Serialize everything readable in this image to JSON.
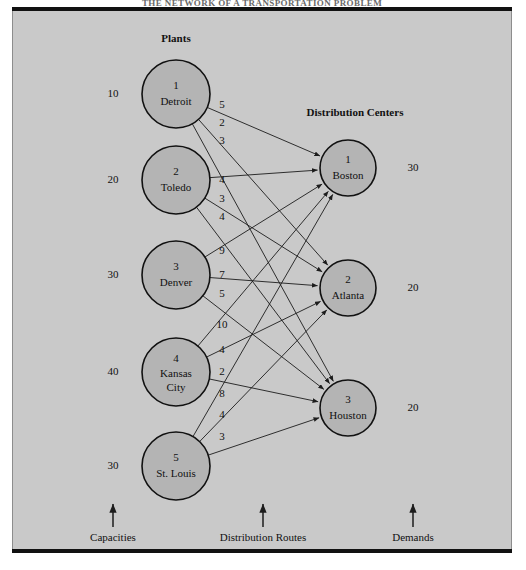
{
  "figure": {
    "top_caption": "THE NETWORK OF A TRANSPORTATION PROBLEM",
    "plants_heading": "Plants",
    "centers_heading": "Distribution Centers"
  },
  "footer": {
    "capacities_label": "Capacities",
    "routes_label": "Distribution Routes",
    "demands_label": "Demands"
  },
  "chart_data": {
    "type": "diagram",
    "title": "THE NETWORK OF A TRANSPORTATION PROBLEM",
    "subtype": "bipartite-transportation-network",
    "sources_group": "Plants",
    "sinks_group": "Distribution Centers",
    "source_value_label": "Capacities",
    "sink_value_label": "Demands",
    "edge_value_label": "Distribution Routes",
    "sources": [
      {
        "index": "1",
        "name": "Detroit",
        "capacity": "10",
        "cx": 176,
        "cy": 94,
        "r": 34
      },
      {
        "index": "2",
        "name": "Toledo",
        "capacity": "20",
        "cx": 176,
        "cy": 180,
        "r": 34
      },
      {
        "index": "3",
        "name": "Denver",
        "capacity": "30",
        "cx": 176,
        "cy": 275,
        "r": 34
      },
      {
        "index": "4",
        "name": "Kansas City",
        "capacity": "40",
        "cx": 176,
        "cy": 372,
        "r": 34
      },
      {
        "index": "5",
        "name": "St. Louis",
        "capacity": "30",
        "cx": 176,
        "cy": 466,
        "r": 34
      }
    ],
    "sinks": [
      {
        "index": "1",
        "name": "Boston",
        "demand": "30",
        "cx": 348,
        "cy": 168,
        "r": 28
      },
      {
        "index": "2",
        "name": "Atlanta",
        "demand": "20",
        "cx": 348,
        "cy": 288,
        "r": 28
      },
      {
        "index": "3",
        "name": "Houston",
        "demand": "20",
        "cx": 348,
        "cy": 408,
        "r": 28
      }
    ],
    "edges": [
      {
        "from": "Detroit",
        "to": "Boston",
        "cost": "5",
        "lx": 222,
        "ly": 105
      },
      {
        "from": "Detroit",
        "to": "Atlanta",
        "cost": "2",
        "lx": 222,
        "ly": 123
      },
      {
        "from": "Detroit",
        "to": "Houston",
        "cost": "3",
        "lx": 222,
        "ly": 141
      },
      {
        "from": "Toledo",
        "to": "Boston",
        "cost": "4",
        "lx": 222,
        "ly": 180
      },
      {
        "from": "Toledo",
        "to": "Atlanta",
        "cost": "3",
        "lx": 222,
        "ly": 199
      },
      {
        "from": "Toledo",
        "to": "Houston",
        "cost": "4",
        "lx": 222,
        "ly": 217
      },
      {
        "from": "Denver",
        "to": "Boston",
        "cost": "9",
        "lx": 222,
        "ly": 251
      },
      {
        "from": "Denver",
        "to": "Atlanta",
        "cost": "7",
        "lx": 222,
        "ly": 275
      },
      {
        "from": "Denver",
        "to": "Houston",
        "cost": "5",
        "lx": 222,
        "ly": 294
      },
      {
        "from": "Kansas City",
        "to": "Boston",
        "cost": "10",
        "lx": 222,
        "ly": 325
      },
      {
        "from": "Kansas City",
        "to": "Atlanta",
        "cost": "4",
        "lx": 222,
        "ly": 350
      },
      {
        "from": "Kansas City",
        "to": "Houston",
        "cost": "2",
        "lx": 222,
        "ly": 372
      },
      {
        "from": "St. Louis",
        "to": "Boston",
        "cost": "8",
        "lx": 222,
        "ly": 394
      },
      {
        "from": "St. Louis",
        "to": "Atlanta",
        "cost": "4",
        "lx": 222,
        "ly": 415
      },
      {
        "from": "St. Louis",
        "to": "Houston",
        "cost": "3",
        "lx": 222,
        "ly": 437
      }
    ],
    "capacities": [
      "10",
      "20",
      "30",
      "40",
      "30"
    ],
    "demands": [
      "30",
      "20",
      "20"
    ],
    "costs_matrix": [
      [
        "5",
        "2",
        "3"
      ],
      [
        "4",
        "3",
        "4"
      ],
      [
        "9",
        "7",
        "5"
      ],
      [
        "10",
        "4",
        "2"
      ],
      [
        "8",
        "4",
        "3"
      ]
    ]
  },
  "colors": {
    "node_fill": "#b4b4b4",
    "plate_bg": "#c9c9c9",
    "ink": "#111111"
  }
}
